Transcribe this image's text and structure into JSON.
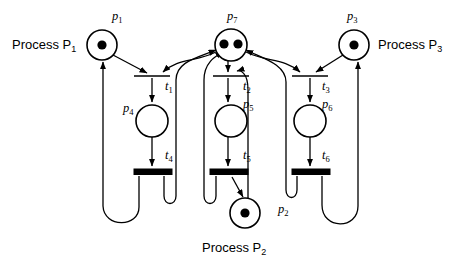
{
  "diagram": {
    "type": "petri-net",
    "background_color": "#ffffff",
    "stroke_color": "#000000"
  },
  "places": [
    {
      "id": "p1",
      "label": "p",
      "subscript": "1",
      "tokens": 1,
      "cx": 102,
      "cy": 45,
      "r": 15
    },
    {
      "id": "p7",
      "label": "p",
      "subscript": "7",
      "tokens": 2,
      "cx": 231,
      "cy": 45,
      "r": 16
    },
    {
      "id": "p3",
      "label": "p",
      "subscript": "3",
      "tokens": 1,
      "cx": 354,
      "cy": 45,
      "r": 15
    },
    {
      "id": "p4",
      "label": "p",
      "subscript": "4",
      "tokens": 0,
      "cx": 152,
      "cy": 121,
      "r": 16
    },
    {
      "id": "p5",
      "label": "p",
      "subscript": "5",
      "tokens": 0,
      "cx": 231,
      "cy": 121,
      "r": 16
    },
    {
      "id": "p6",
      "label": "p",
      "subscript": "6",
      "tokens": 0,
      "cx": 310,
      "cy": 121,
      "r": 16
    },
    {
      "id": "p2",
      "label": "p",
      "subscript": "2",
      "tokens": 1,
      "cx": 245,
      "cy": 213,
      "r": 15
    }
  ],
  "transitions": [
    {
      "id": "t1",
      "label": "t",
      "subscript": "1",
      "cx": 152,
      "cy": 76,
      "width": 36,
      "style": "thin"
    },
    {
      "id": "t2",
      "label": "t",
      "subscript": "2",
      "cx": 231,
      "cy": 76,
      "width": 36,
      "style": "thin"
    },
    {
      "id": "t3",
      "label": "t",
      "subscript": "3",
      "cx": 310,
      "cy": 76,
      "width": 36,
      "style": "thin"
    },
    {
      "id": "t4",
      "label": "t",
      "subscript": "4",
      "cx": 152,
      "cy": 172,
      "width": 36,
      "style": "thick"
    },
    {
      "id": "t5",
      "label": "t",
      "subscript": "5",
      "cx": 231,
      "cy": 172,
      "width": 36,
      "style": "thick"
    },
    {
      "id": "t6",
      "label": "t",
      "subscript": "6",
      "cx": 310,
      "cy": 172,
      "width": 36,
      "style": "thick"
    }
  ],
  "place_labels": [
    {
      "id": "p1-label",
      "text": "p",
      "sub": "1",
      "x": 112,
      "y": 20
    },
    {
      "id": "p7-label",
      "text": "p",
      "sub": "7",
      "x": 227,
      "y": 20
    },
    {
      "id": "p3-label",
      "text": "p",
      "sub": "3",
      "x": 347,
      "y": 20
    },
    {
      "id": "p4-label",
      "text": "p",
      "sub": "4",
      "x": 123,
      "y": 112
    },
    {
      "id": "p5-label",
      "text": "p",
      "sub": "5",
      "x": 243,
      "y": 108
    },
    {
      "id": "p6-label",
      "text": "p",
      "sub": "6",
      "x": 322,
      "y": 108
    },
    {
      "id": "p2-label",
      "text": "p",
      "sub": "2",
      "x": 278,
      "y": 213
    }
  ],
  "transition_labels": [
    {
      "id": "t1-label",
      "text": "t",
      "sub": "1",
      "x": 165,
      "y": 90
    },
    {
      "id": "t2-label",
      "text": "t",
      "sub": "2",
      "x": 243,
      "y": 90
    },
    {
      "id": "t3-label",
      "text": "t",
      "sub": "3",
      "x": 322,
      "y": 90
    },
    {
      "id": "t4-label",
      "text": "t",
      "sub": "4",
      "x": 165,
      "y": 159
    },
    {
      "id": "t5-label",
      "text": "t",
      "sub": "5",
      "x": 243,
      "y": 159
    },
    {
      "id": "t6-label",
      "text": "t",
      "sub": "6",
      "x": 322,
      "y": 159
    }
  ],
  "process_labels": [
    {
      "id": "process-p1",
      "text": "Process P",
      "sub": "1",
      "x": 12,
      "y": 48,
      "anchor": "start"
    },
    {
      "id": "process-p3",
      "text": "Process P",
      "sub": "3",
      "x": 378,
      "y": 48,
      "anchor": "start"
    },
    {
      "id": "process-p2",
      "text": "Process P",
      "sub": "2",
      "x": 202,
      "y": 251,
      "anchor": "start"
    }
  ],
  "arcs": [
    {
      "id": "p1-to-t1",
      "from": "p1",
      "to": "t1"
    },
    {
      "id": "t1-to-p4",
      "from": "t1",
      "to": "p4"
    },
    {
      "id": "p4-to-t4",
      "from": "p4",
      "to": "t4"
    },
    {
      "id": "t4-to-p1",
      "from": "t4",
      "to": "p1"
    },
    {
      "id": "p7-to-t1",
      "from": "p7",
      "to": "t1"
    },
    {
      "id": "t4-to-p7",
      "from": "t4",
      "to": "p7"
    },
    {
      "id": "p7-to-t2",
      "from": "p7",
      "to": "t2"
    },
    {
      "id": "t2-to-p5",
      "from": "t2",
      "to": "p5"
    },
    {
      "id": "p5-to-t5",
      "from": "p5",
      "to": "t5"
    },
    {
      "id": "t5-to-p2",
      "from": "t5",
      "to": "p2"
    },
    {
      "id": "p2-to-t2",
      "from": "p2",
      "to": "t2"
    },
    {
      "id": "t5-to-p7",
      "from": "t5",
      "to": "p7"
    },
    {
      "id": "p7-to-t3",
      "from": "p7",
      "to": "t3"
    },
    {
      "id": "t3-to-p6",
      "from": "t3",
      "to": "p6"
    },
    {
      "id": "p6-to-t6",
      "from": "p6",
      "to": "t6"
    },
    {
      "id": "t6-to-p3",
      "from": "t6",
      "to": "p3"
    },
    {
      "id": "p3-to-t3",
      "from": "p3",
      "to": "t3"
    },
    {
      "id": "t6-to-p7",
      "from": "t6",
      "to": "p7"
    }
  ]
}
